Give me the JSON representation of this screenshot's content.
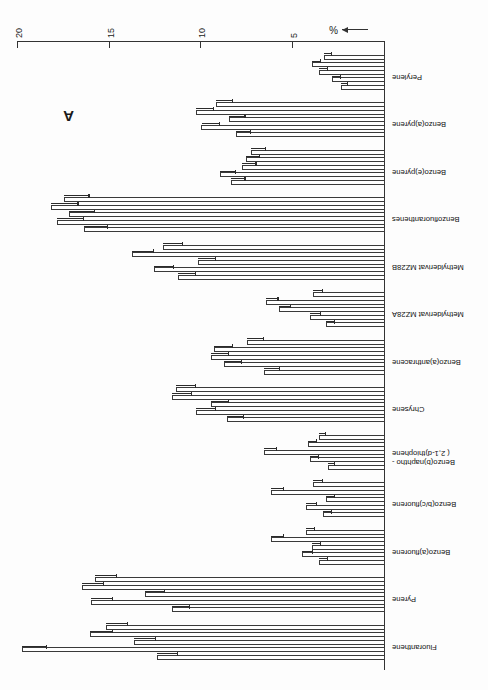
{
  "figure": {
    "panel_label": "A",
    "axis_unit_label": "%",
    "axis_arrow": "left-arrow-icon"
  },
  "chart_data": {
    "type": "bar",
    "orientation": "horizontal",
    "title": "A",
    "xlabel": "%",
    "ylabel": "",
    "xlim": [
      0,
      20
    ],
    "xticks": [
      5,
      10,
      15,
      20
    ],
    "xticklabels": [
      "5",
      "10",
      "15",
      "20"
    ],
    "grid": false,
    "legend": "none",
    "note": "Figure printed rotated 180 degrees; 5 replicate bars per compound with error bars.",
    "categories": [
      "Fluoranthene",
      "Pyrene",
      "Benzo(a)fluorene",
      "Benzo(b/c)fluorene",
      "Benzo(b)naphtho-(2,1-d)thiophene",
      "Chrysene",
      "Benzo(a)anthracene",
      "Methylderivat MZ28A",
      "Methylderivat MZ28B",
      "Benzofluoranthenes",
      "Benzo(e)pyrene",
      "Benzo(a)pyrene",
      "Perylene"
    ],
    "category_labels_multiline": [
      [
        "Fluoranthene"
      ],
      [
        "Pyrene"
      ],
      [
        "Benzo(a)fluorene"
      ],
      [
        "Benzo(b/c)fluorene"
      ],
      [
        "Benzo(b)naphtho -",
        "( 2,1-d)thiophene"
      ],
      [
        "Chrysene"
      ],
      [
        "Benzo(a)anthracene"
      ],
      [
        "Methylderivat MZ28A"
      ],
      [
        "Methylderivat MZ28B"
      ],
      [
        "Benzofluoranthenes"
      ],
      [
        "Benzo(e)pyrene"
      ],
      [
        "Benzo(a)pyrene"
      ],
      [
        "Perylene"
      ]
    ],
    "series": [
      {
        "name": "Sample 1",
        "values": [
          12.4,
          11.6,
          3.6,
          3.4,
          3.1,
          8.6,
          6.6,
          3.2,
          11.3,
          16.4,
          8.4,
          8.1,
          2.4
        ]
      },
      {
        "name": "Sample 2",
        "values": [
          19.8,
          16.0,
          4.5,
          4.3,
          4.1,
          10.3,
          8.8,
          4.1,
          12.6,
          17.9,
          9.0,
          10.0,
          2.9
        ]
      },
      {
        "name": "Sample 3",
        "values": [
          13.7,
          13.1,
          4.0,
          3.2,
          6.6,
          9.5,
          9.5,
          5.8,
          10.2,
          17.2,
          7.8,
          8.5,
          3.6
        ]
      },
      {
        "name": "Sample 4",
        "values": [
          16.1,
          16.5,
          6.2,
          6.2,
          4.2,
          11.6,
          9.3,
          6.5,
          13.8,
          18.2,
          7.6,
          10.3,
          4.0
        ]
      },
      {
        "name": "Sample 5",
        "values": [
          15.2,
          15.8,
          4.3,
          3.9,
          3.6,
          11.4,
          7.5,
          3.9,
          12.1,
          17.5,
          7.3,
          9.2,
          3.3
        ]
      }
    ],
    "errors": [
      {
        "name": "Sample 1",
        "values": [
          1.1,
          1.0,
          0.5,
          0.5,
          0.4,
          0.9,
          0.9,
          0.5,
          1.0,
          1.3,
          0.8,
          0.8,
          0.4
        ]
      },
      {
        "name": "Sample 2",
        "values": [
          1.4,
          1.2,
          0.6,
          0.6,
          0.5,
          1.1,
          1.0,
          0.6,
          1.1,
          1.5,
          0.9,
          1.0,
          0.5
        ]
      },
      {
        "name": "Sample 3",
        "values": [
          1.2,
          1.1,
          0.5,
          0.5,
          0.7,
          1.0,
          1.0,
          0.7,
          1.0,
          1.4,
          0.8,
          0.9,
          0.5
        ]
      },
      {
        "name": "Sample 4",
        "values": [
          1.3,
          1.2,
          0.7,
          0.7,
          0.5,
          1.1,
          1.0,
          0.7,
          1.2,
          1.5,
          0.8,
          1.0,
          0.5
        ]
      },
      {
        "name": "Sample 5",
        "values": [
          1.2,
          1.2,
          0.5,
          0.5,
          0.4,
          1.1,
          0.9,
          0.5,
          1.1,
          1.4,
          0.8,
          0.9,
          0.4
        ]
      }
    ]
  }
}
